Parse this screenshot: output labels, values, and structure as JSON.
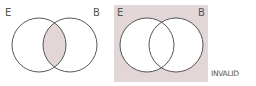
{
  "diagrams": [
    {
      "id": "left",
      "labels": {
        "left_set": "E",
        "right_set": "B"
      },
      "shaded_region": "intersection",
      "shade_color": "#e2d6d6"
    },
    {
      "id": "right",
      "labels": {
        "left_set": "E",
        "right_set": "B"
      },
      "shaded_region": "background outside both circles",
      "shade_color": "#e2d6d6",
      "verdict": "INVALID"
    }
  ],
  "colors": {
    "stroke": "#444444",
    "shade": "#e2d6d6",
    "text": "#555555"
  }
}
